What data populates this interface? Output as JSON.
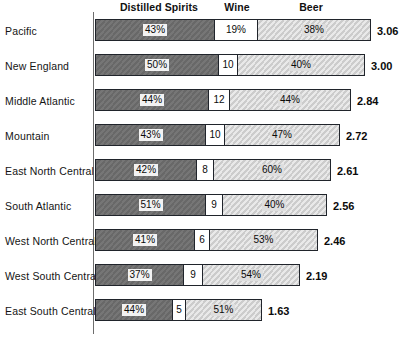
{
  "chart_data": {
    "type": "bar",
    "subtype": "stacked-horizontal-percent",
    "title": "",
    "xlabel": "",
    "ylabel": "",
    "grid": false,
    "legend_position": "top",
    "categories": [
      "Pacific",
      "New England",
      "Middle Atlantic",
      "Mountain",
      "East North Central",
      "South Atlantic",
      "West North Central",
      "West South Central",
      "East South Central"
    ],
    "series": [
      {
        "name": "Distilled Spirits",
        "values": [
          43,
          50,
          44,
          43,
          42,
          51,
          41,
          37,
          44
        ],
        "labels": [
          "43%",
          "50%",
          "44%",
          "43%",
          "42%",
          "51%",
          "41%",
          "37%",
          "44%"
        ],
        "color": "#6e6e6e"
      },
      {
        "name": "Wine",
        "values": [
          19,
          10,
          12,
          10,
          8,
          9,
          6,
          9,
          5
        ],
        "labels": [
          "19%",
          "10",
          "12",
          "10",
          "8",
          "9",
          "6",
          "9",
          "5"
        ],
        "color": "#ffffff"
      },
      {
        "name": "Beer",
        "values": [
          38,
          40,
          44,
          47,
          60,
          40,
          53,
          54,
          51
        ],
        "labels": [
          "38%",
          "40%",
          "44%",
          "47%",
          "60%",
          "40%",
          "53%",
          "54%",
          "51%"
        ],
        "color": "#d2d2d2"
      }
    ],
    "totals": [
      3.06,
      3.0,
      2.84,
      2.72,
      2.61,
      2.56,
      2.46,
      2.19,
      1.63
    ],
    "total_labels": [
      "3.06",
      "3.00",
      "2.84",
      "2.72",
      "2.61",
      "2.56",
      "2.46",
      "2.19",
      "1.63"
    ],
    "bar_pixel_widths": [
      276,
      270,
      256,
      245,
      236,
      232,
      223,
      205,
      167
    ],
    "segment_pixel_widths": [
      [
        119,
        44,
        113
      ],
      [
        123,
        20,
        127
      ],
      [
        113,
        22,
        121
      ],
      [
        110,
        20,
        115
      ],
      [
        101,
        18,
        117
      ],
      [
        110,
        18,
        104
      ],
      [
        99,
        16,
        108
      ],
      [
        88,
        20,
        97
      ],
      [
        77,
        14,
        76
      ]
    ]
  },
  "headers": {
    "spirits": "Distilled Spirits",
    "wine": "Wine",
    "beer": "Beer"
  }
}
